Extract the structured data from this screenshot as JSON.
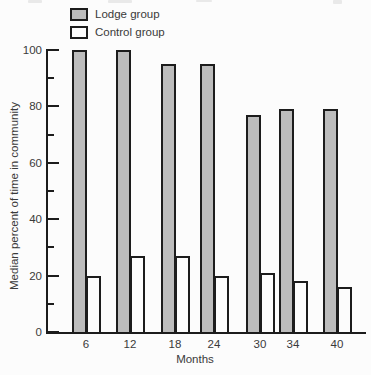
{
  "legend": {
    "items": [
      {
        "label": "Lodge group",
        "swatch": "lodge-swatch"
      },
      {
        "label": "Control group",
        "swatch": "control-swatch"
      }
    ]
  },
  "chart_data": {
    "type": "bar",
    "title": "",
    "categories": [
      "6",
      "12",
      "18",
      "24",
      "30",
      "34",
      "40"
    ],
    "series": [
      {
        "name": "Lodge group",
        "values": [
          100,
          100,
          95,
          95,
          77,
          79,
          79
        ],
        "fill": "#bcbcbc"
      },
      {
        "name": "Control group",
        "values": [
          20,
          27,
          27,
          20,
          21,
          18,
          16
        ],
        "fill": "#fcfcfc"
      }
    ],
    "xlabel": "Months",
    "ylabel": "Median percent of time in community",
    "ylim": [
      0,
      100
    ],
    "yticks_major": [
      0,
      20,
      40,
      60,
      80,
      100
    ],
    "yticks_minor": [
      10,
      30,
      50,
      70,
      90
    ],
    "grid": false,
    "legend_position": "top-left",
    "colors": {
      "lodge_fill": "#bcbcbc",
      "control_fill": "#fcfcfc",
      "outline": "#1c1c1c",
      "text": "#3a3a3a"
    }
  }
}
